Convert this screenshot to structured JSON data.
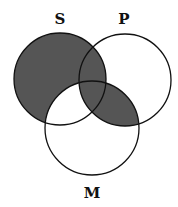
{
  "diagram": {
    "type": "venn-3",
    "sets": [
      {
        "name": "S",
        "label": "S",
        "cx": 60,
        "cy": 79,
        "r": 46,
        "label_x": 60,
        "label_y": 24
      },
      {
        "name": "P",
        "label": "P",
        "cx": 125,
        "cy": 80,
        "r": 46,
        "label_x": 124,
        "label_y": 24
      },
      {
        "name": "M",
        "label": "M",
        "cx": 92,
        "cy": 128,
        "r": 47,
        "label_x": 92,
        "label_y": 198
      }
    ],
    "shaded_regions": [
      "S only",
      "S∩P only",
      "S∩P∩M",
      "P∩M only"
    ],
    "unshaded_regions": [
      "P only",
      "M only",
      "S∩M only"
    ],
    "colors": {
      "shade": "#555555",
      "stroke": "#111111",
      "background": "#ffffff"
    }
  }
}
